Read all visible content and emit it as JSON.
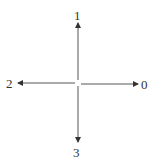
{
  "diagram": {
    "title": "",
    "type": "direction-arrows",
    "line_color": "#333333",
    "labels": {
      "east": "0",
      "north": "1",
      "west": "2",
      "south": "3"
    }
  }
}
